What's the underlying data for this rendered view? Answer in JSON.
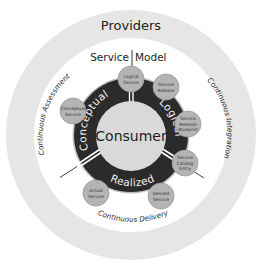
{
  "diagram": {
    "outer_ring_label": "Providers",
    "header": {
      "left": "Service",
      "right": "Model"
    },
    "center_label": "Consumer",
    "phases": [
      {
        "label": "Conceptual"
      },
      {
        "label": "Logical"
      },
      {
        "label": "Realized"
      }
    ],
    "practices": [
      {
        "label": "Continuous Assessment"
      },
      {
        "label": "Continuous Integration"
      },
      {
        "label": "Continuous Delivery"
      }
    ],
    "nodes": [
      {
        "id": "conceptual-service",
        "lines": [
          "Conceptual",
          "Service"
        ]
      },
      {
        "id": "logical-service",
        "lines": [
          "Logical",
          "Service"
        ]
      },
      {
        "id": "service-release",
        "lines": [
          "Service",
          "Release"
        ]
      },
      {
        "id": "service-release-blueprint",
        "lines": [
          "Service",
          "Release",
          "Blueprint"
        ]
      },
      {
        "id": "service-catalog-entry",
        "lines": [
          "Service",
          "Catalog",
          "Entry"
        ]
      },
      {
        "id": "desired-service",
        "lines": [
          "Desired",
          "Service"
        ]
      },
      {
        "id": "actual-service",
        "lines": [
          "Actual",
          "Service"
        ]
      }
    ],
    "colors": {
      "outer_ring": "#e6e6e6",
      "inner_field": "#ffffff",
      "phase_ring": "#2b2b2b",
      "phase_ring_edge": "#bdbdbd",
      "center_circle": "#d9d9d9",
      "node_fill": "#b4b4b4",
      "node_stroke": "#9a9a9a",
      "text": "#1e1e1e"
    }
  }
}
